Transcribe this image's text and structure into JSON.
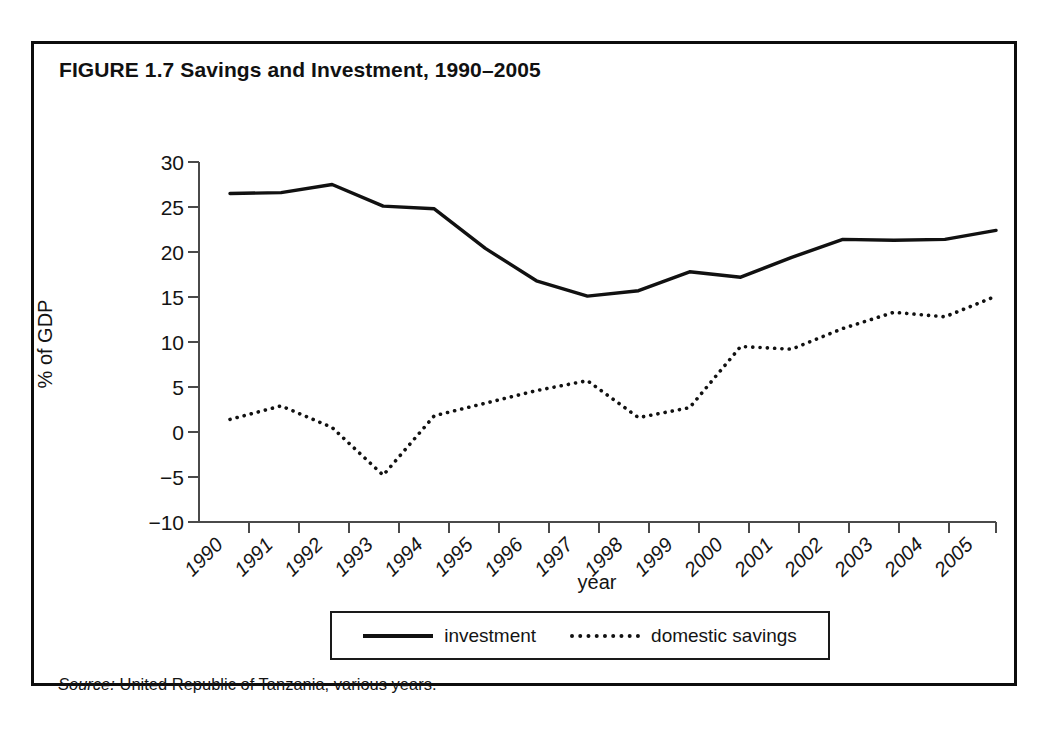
{
  "figure": {
    "title": "FIGURE 1.7  Savings and Investment, 1990–2005",
    "source_prefix": "Source:",
    "source_text": " United Republic of Tanzania, various years."
  },
  "legend": {
    "investment_label": "investment",
    "savings_label": "domestic savings"
  },
  "chart_data": {
    "type": "line",
    "title": "FIGURE 1.7  Savings and Investment, 1990–2005",
    "xlabel": "year",
    "ylabel": "% of GDP",
    "x": [
      1990,
      1991,
      1992,
      1993,
      1994,
      1995,
      1996,
      1997,
      1998,
      1999,
      2000,
      2001,
      2002,
      2003,
      2004,
      2005
    ],
    "xticklabels": [
      "1990",
      "1991",
      "1992",
      "1993",
      "1994",
      "1995",
      "1996",
      "1997",
      "1998",
      "1999",
      "2000",
      "2001",
      "2002",
      "2003",
      "2004",
      "2005"
    ],
    "yticks": [
      -10,
      -5,
      0,
      5,
      10,
      15,
      20,
      25,
      30
    ],
    "yticklabels": [
      "−10",
      "−5",
      "0",
      "5",
      "10",
      "15",
      "20",
      "25",
      "30"
    ],
    "ylim": [
      -10,
      30
    ],
    "grid": false,
    "legend_position": "below-axes",
    "series": [
      {
        "name": "investment",
        "linestyle": "solid",
        "color": "#111111",
        "values": [
          26.5,
          26.6,
          27.5,
          25.1,
          24.8,
          20.4,
          16.8,
          15.1,
          15.7,
          17.8,
          17.2,
          19.4,
          21.4,
          21.3,
          21.4,
          22.4
        ]
      },
      {
        "name": "domestic savings",
        "linestyle": "dotted",
        "color": "#111111",
        "values": [
          1.4,
          2.9,
          0.5,
          -4.8,
          1.8,
          3.2,
          4.6,
          5.7,
          1.6,
          2.7,
          9.5,
          9.2,
          11.5,
          13.3,
          12.8,
          11.7
        ]
      }
    ],
    "series_note": "domestic savings 2005 = 15.1"
  },
  "axes": {
    "ylabel": "% of GDP",
    "xlabel": "year",
    "yticklabels": [
      "30",
      "25",
      "20",
      "15",
      "10",
      "5",
      "0",
      "−5",
      "−10"
    ],
    "xticklabels": [
      "1990",
      "1991",
      "1992",
      "1993",
      "1994",
      "1995",
      "1996",
      "1997",
      "1998",
      "1999",
      "2000",
      "2001",
      "2002",
      "2003",
      "2004",
      "2005"
    ]
  }
}
